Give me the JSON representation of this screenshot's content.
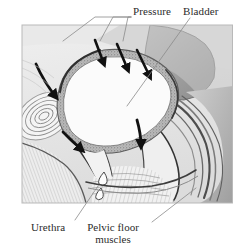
{
  "figure": {
    "style": "grayscale medical illustration",
    "frame": {
      "x": 22,
      "y": 25,
      "width": 211,
      "height": 178
    }
  },
  "labels": {
    "pressure": "Pressure",
    "bladder": "Bladder",
    "urethra": "Urethra",
    "pelvic_floor_line1": "Pelvic floor",
    "pelvic_floor_line2": "muscles"
  },
  "colors": {
    "background": "#ffffff",
    "text": "#2b2b2b",
    "leader_line": "#8a8a8a",
    "frame_border": "#b9b9b9",
    "arrow": "#111111",
    "bladder_fill": "#fbfbfb",
    "bladder_wall": "#9a9a9a",
    "tissue_light": "#e3e3e3",
    "tissue_mid": "#c4c4c4",
    "tissue_dark": "#9d9d9d",
    "tissue_darker": "#7d7d7d",
    "outline": "#3a3a3a",
    "droplet_outline": "#4a4a4a"
  },
  "annotations": {
    "pressure_arrows": [
      {
        "name": "pressure-arrow-1",
        "x1": 95,
        "y1": 40,
        "x2": 104,
        "y2": 66
      },
      {
        "name": "pressure-arrow-2",
        "x1": 117,
        "y1": 44,
        "x2": 128,
        "y2": 72
      },
      {
        "name": "pressure-arrow-3",
        "x1": 137,
        "y1": 50,
        "x2": 150,
        "y2": 79
      },
      {
        "name": "pressure-arrow-left-curved",
        "x1": 36,
        "y1": 64,
        "x2": 57,
        "y2": 99
      },
      {
        "name": "pressure-arrow-lower",
        "x1": 63,
        "y1": 132,
        "x2": 83,
        "y2": 152
      },
      {
        "name": "pressure-arrow-bladder-neck",
        "x1": 138,
        "y1": 120,
        "x2": 142,
        "y2": 148
      }
    ],
    "droplets": [
      {
        "name": "urine-droplet-upper",
        "cx": 104,
        "cy": 178,
        "r": 5
      },
      {
        "name": "urine-droplet-lower",
        "cx": 101,
        "cy": 193,
        "r": 4.4
      }
    ]
  },
  "leaders": {
    "pressure": [
      {
        "x1": 131,
        "y1": 17,
        "x2": 95,
        "y2": 17,
        "x3": 63,
        "y3": 41
      },
      {
        "x1": 131,
        "y1": 17,
        "x2": 113,
        "y2": 17,
        "x3": 100,
        "y3": 41
      },
      {
        "x1": 131,
        "y1": 17,
        "x2": 128,
        "y2": 17,
        "x3": 123,
        "y3": 41
      }
    ],
    "bladder": {
      "x1": 190,
      "y1": 18,
      "x2": 127,
      "y2": 106
    },
    "urethra": {
      "x1": 75,
      "y1": 220,
      "x2": 98,
      "y2": 186
    },
    "pelvic_floor": {
      "x1": 152,
      "y1": 222,
      "x2": 196,
      "y2": 188
    }
  }
}
